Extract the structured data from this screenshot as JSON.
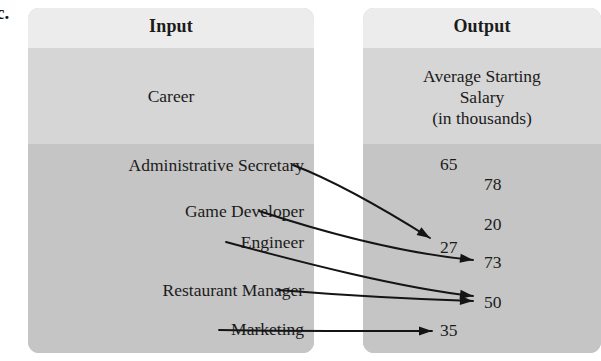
{
  "part_label": "c.",
  "input_panel": {
    "title": "Input",
    "subtitle": "Career",
    "items": [
      {
        "label": "Administrative Secretary",
        "y": 166
      },
      {
        "label": "Game Developer",
        "y": 212
      },
      {
        "label": "Engineer",
        "y": 243
      },
      {
        "label": "Restaurant Manager",
        "y": 291
      },
      {
        "label": "Marketing",
        "y": 330
      }
    ]
  },
  "output_panel": {
    "title": "Output",
    "subtitle": "Average Starting\nSalary\n(in thousands)",
    "subtitle_lines": [
      "Average Starting",
      "Salary",
      "(in thousands)"
    ],
    "items": [
      {
        "label": "65",
        "x": 440,
        "y": 154
      },
      {
        "label": "78",
        "x": 484,
        "y": 174
      },
      {
        "label": "20",
        "x": 484,
        "y": 214
      },
      {
        "label": "27",
        "x": 440,
        "y": 237
      },
      {
        "label": "73",
        "x": 484,
        "y": 252
      },
      {
        "label": "50",
        "x": 484,
        "y": 292
      },
      {
        "label": "35",
        "x": 440,
        "y": 320
      }
    ]
  },
  "chart_data": {
    "type": "diagram",
    "xlabel": "Input",
    "ylabel": "Output",
    "input_header": "Input",
    "input_category": "Career",
    "output_header": "Output",
    "output_category": "Average Starting Salary (in thousands)",
    "pairs": [
      {
        "input": "Administrative Secretary",
        "output": "27"
      },
      {
        "input": "Game Developer",
        "output": "73"
      },
      {
        "input": "Engineer",
        "output": "50"
      },
      {
        "input": "Restaurant Manager",
        "output": "50"
      },
      {
        "input": "Marketing",
        "output": "35"
      }
    ],
    "unmapped_outputs": [
      "65",
      "78",
      "20"
    ],
    "all_outputs": [
      "65",
      "78",
      "20",
      "27",
      "73",
      "50",
      "35"
    ],
    "legend": [],
    "grid": false
  },
  "arrows": [
    {
      "from": "Administrative Secretary",
      "to": "27",
      "d": "M 293 165 C 340 183, 395 216, 430 238",
      "tip": "430,238",
      "angle": 32
    },
    {
      "from": "Game Developer",
      "to": "73",
      "d": "M 259 211 C 320 231, 400 253, 473 260",
      "tip": "473,260",
      "angle": 8
    },
    {
      "from": "Engineer",
      "to": "50",
      "d": "M 226 242 C 300 262, 400 288, 473 296",
      "tip": "473,296",
      "angle": 7
    },
    {
      "from": "Restaurant Manager",
      "to": "50",
      "d": "M 278 290 C 340 295, 410 299, 473 301",
      "tip": "473,301",
      "angle": 3
    },
    {
      "from": "Marketing",
      "to": "35",
      "d": "M 219 330 C 280 331, 370 331, 432 331",
      "tip": "432,331",
      "angle": 0
    }
  ],
  "colors": {
    "panel_header_band": "#ececec",
    "panel_sub_band": "#d6d6d6",
    "panel_body_band": "#c5c5c5",
    "text": "#1b1b1b",
    "arrow": "#141414",
    "page_background": "#ffffff"
  }
}
